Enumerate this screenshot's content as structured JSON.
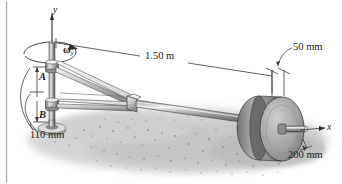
{
  "figure": {
    "background_color": "#ffffff",
    "border_color": "#a8a8a8",
    "ink_color": "#1a1a1a",
    "ground_color": "#c9c9c9",
    "metal_light": "#d8d8d8",
    "metal_mid": "#9e9e9e",
    "metal_dark": "#6e6e6e"
  },
  "axes": {
    "vertical": {
      "label": "y",
      "name": "y-axis"
    },
    "horizontal": {
      "label": "x",
      "name": "x-axis"
    }
  },
  "rotation": {
    "symbol": "ω",
    "subscript": "y",
    "name": "angular-velocity-omega-y"
  },
  "points": [
    {
      "id": "A",
      "label": "A",
      "role": "upper-bearing"
    },
    {
      "id": "B",
      "label": "B",
      "role": "lower-bearing"
    }
  ],
  "dimensions": [
    {
      "id": "span",
      "label": "1.50 m",
      "value": 1.5,
      "unit": "m",
      "describes": "horizontal-rod-length"
    },
    {
      "id": "offset",
      "label": "50 mm",
      "value": 50,
      "unit": "mm",
      "describes": "disk-offset-from-rod-end"
    },
    {
      "id": "diameter",
      "label": "200 mm",
      "value": 200,
      "unit": "mm",
      "describes": "disk-diameter"
    },
    {
      "id": "bearings",
      "label": "110 mm",
      "value": 110,
      "unit": "mm",
      "describes": "bearing-spacing-A-to-B"
    }
  ]
}
